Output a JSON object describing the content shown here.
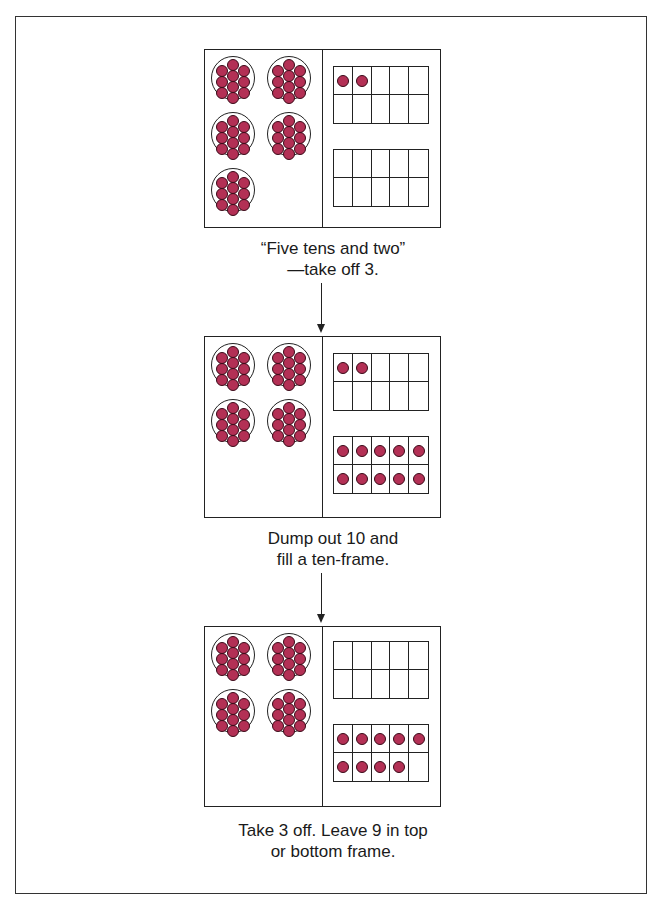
{
  "figure": {
    "counter_color": "#b33055",
    "steps": [
      {
        "cups_of_ten": 5,
        "top_frame_count": 2,
        "bottom_frame_count": 0,
        "caption_line1": "“Five tens and two”",
        "caption_line2": "—take off 3."
      },
      {
        "cups_of_ten": 4,
        "top_frame_count": 2,
        "bottom_frame_count": 10,
        "caption_line1": "Dump out 10 and",
        "caption_line2": "fill a ten-frame."
      },
      {
        "cups_of_ten": 4,
        "top_frame_count": 0,
        "bottom_frame_count": 9,
        "caption_line1": "Take 3 off. Leave 9 in top",
        "caption_line2": "or bottom frame."
      }
    ]
  }
}
